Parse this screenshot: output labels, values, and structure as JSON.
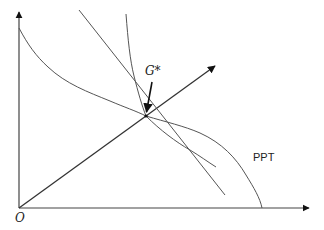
{
  "diagram": {
    "type": "economic-diagram",
    "labels": {
      "origin": "O",
      "equilibrium": "G*",
      "curve": "PPT"
    },
    "colors": {
      "axis": "#444444",
      "curve": "#555555",
      "arrow": "#111111",
      "background": "#ffffff"
    },
    "elements": [
      {
        "name": "y-axis",
        "kind": "arrow",
        "from": [
          19,
          208
        ],
        "to": [
          19,
          10
        ]
      },
      {
        "name": "x-axis",
        "kind": "arrow",
        "from": [
          19,
          208
        ],
        "to": [
          311,
          208
        ]
      },
      {
        "name": "ray-from-origin",
        "kind": "arrow",
        "from": [
          19,
          208
        ],
        "to": [
          217,
          65
        ]
      },
      {
        "name": "ppt-curve",
        "kind": "curve",
        "label": "PPT"
      },
      {
        "name": "straight-steep-line",
        "kind": "line",
        "from": [
          79,
          10
        ],
        "to": [
          225,
          195
        ]
      },
      {
        "name": "steep-curve",
        "kind": "curve"
      },
      {
        "name": "equilibrium-pointer",
        "kind": "arrow",
        "label": "G*",
        "to": [
          146,
          114
        ]
      }
    ]
  }
}
